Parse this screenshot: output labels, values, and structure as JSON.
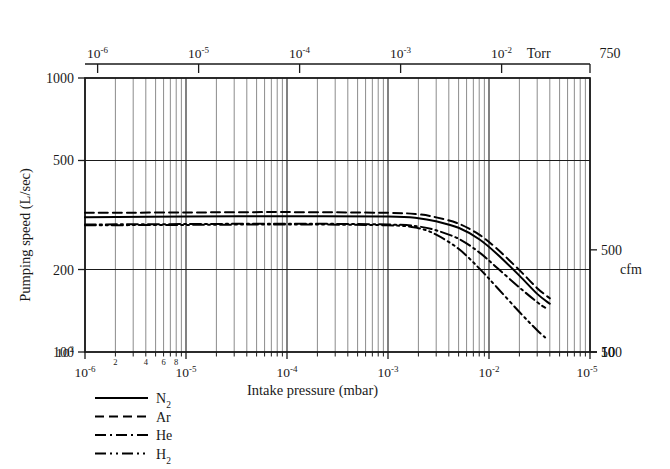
{
  "chart_data": {
    "type": "line",
    "title": "",
    "xlabel": "Intake pressure  (mbar)",
    "ylabel": "Pumping speed  (L/sec)",
    "x_scale": "log",
    "y_scale": "log",
    "xlim": [
      1e-06,
      0.1
    ],
    "ylim": [
      100,
      1000
    ],
    "grid": true,
    "legend_position": "below-left",
    "bottom_axis": {
      "unit": "mbar",
      "tick_labels": [
        "10",
        "10",
        "10",
        "10",
        "10"
      ],
      "tick_exponents": [
        "-6",
        "-5",
        "-4",
        "-3",
        "-2"
      ],
      "last_label_base": "10",
      "last_label_exponent": "-5",
      "minor_labels": [
        "2",
        "4",
        "6",
        "8"
      ]
    },
    "top_axis": {
      "unit": "Torr",
      "tick_labels": [
        "10",
        "10",
        "10",
        "10",
        "10"
      ],
      "tick_exponents": [
        "-6",
        "-5",
        "-4",
        "-3",
        "-2"
      ],
      "end_label": "750"
    },
    "left_axis": {
      "unit": "L/sec",
      "tick_labels": [
        "1000",
        "500",
        "200",
        "100"
      ],
      "corner_label_base": "10",
      "corner_label_exponent": "2"
    },
    "right_axis": {
      "unit": "cfm",
      "tick_labels": [
        "500",
        "100",
        "50",
        "10"
      ]
    },
    "series": [
      {
        "name": "N2",
        "label_base": "N",
        "label_sub": "2",
        "style": "solid",
        "points": [
          [
            1e-06,
            310
          ],
          [
            1e-05,
            312
          ],
          [
            0.0001,
            313
          ],
          [
            0.001,
            312
          ],
          [
            0.002,
            308
          ],
          [
            0.003,
            300
          ],
          [
            0.005,
            284
          ],
          [
            0.008,
            258
          ],
          [
            0.012,
            228
          ],
          [
            0.02,
            190
          ],
          [
            0.03,
            163
          ],
          [
            0.04,
            150
          ]
        ]
      },
      {
        "name": "Ar",
        "label_base": "Ar",
        "label_sub": "",
        "style": "dashed",
        "points": [
          [
            1e-06,
            322
          ],
          [
            1e-05,
            323
          ],
          [
            0.0001,
            324
          ],
          [
            0.001,
            322
          ],
          [
            0.002,
            318
          ],
          [
            0.003,
            310
          ],
          [
            0.005,
            294
          ],
          [
            0.008,
            268
          ],
          [
            0.012,
            238
          ],
          [
            0.02,
            199
          ],
          [
            0.03,
            171
          ],
          [
            0.04,
            157
          ]
        ]
      },
      {
        "name": "He",
        "label_base": "He",
        "label_sub": "",
        "style": "dash-dot",
        "points": [
          [
            1e-06,
            292
          ],
          [
            1e-05,
            293
          ],
          [
            0.0001,
            294
          ],
          [
            0.001,
            292
          ],
          [
            0.002,
            287
          ],
          [
            0.003,
            278
          ],
          [
            0.005,
            259
          ],
          [
            0.008,
            231
          ],
          [
            0.012,
            203
          ],
          [
            0.02,
            172
          ],
          [
            0.03,
            152
          ],
          [
            0.036,
            145
          ]
        ]
      },
      {
        "name": "H2",
        "label_base": "H",
        "label_sub": "2",
        "style": "dash-dot-dot",
        "points": [
          [
            1e-06,
            290
          ],
          [
            1e-05,
            291
          ],
          [
            0.0001,
            292
          ],
          [
            0.001,
            290
          ],
          [
            0.002,
            283
          ],
          [
            0.003,
            268
          ],
          [
            0.005,
            238
          ],
          [
            0.008,
            202
          ],
          [
            0.012,
            172
          ],
          [
            0.02,
            140
          ],
          [
            0.03,
            120
          ],
          [
            0.036,
            113
          ]
        ]
      }
    ]
  }
}
